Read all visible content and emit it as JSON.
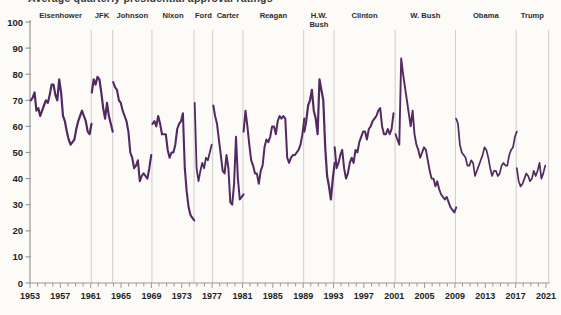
{
  "title": {
    "text": "Average quarterly presidential approval ratings"
  },
  "chart_data": {
    "type": "line",
    "title": "Average quarterly presidential approval ratings",
    "xlabel": "",
    "ylabel": "",
    "ylim": [
      0,
      100
    ],
    "yticks": [
      0,
      10,
      20,
      30,
      40,
      50,
      60,
      70,
      80,
      90,
      100
    ],
    "xticks": [
      1953,
      1957,
      1961,
      1965,
      1969,
      1973,
      1977,
      1981,
      1985,
      1989,
      1993,
      1997,
      2001,
      2005,
      2009,
      2013,
      2017,
      2021
    ],
    "x_start": 1953,
    "x_end": 2021.35,
    "grid": "vertical-president-boundaries-only",
    "legend": "none",
    "line_color": "#522a61",
    "grid_color": "#cdcdcd",
    "axis_color": "#9a9a9a",
    "boundaries": [
      1961.07,
      1963.9,
      1969.07,
      1974.62,
      1977.07,
      1981.07,
      1989.07,
      1993.07,
      2001.12,
      2009.07,
      2017.07,
      2021.35
    ],
    "quarter_step": 0.25,
    "presidents": [
      {
        "name": "Eisenhower",
        "label_lines": [
          "Eisenhower"
        ],
        "start": 1953.1,
        "stroke_width": 2.2,
        "values": [
          70,
          71,
          73,
          66,
          67,
          64,
          66,
          68,
          70,
          69,
          72,
          76,
          76,
          72,
          70,
          78,
          73,
          64,
          62,
          58,
          55,
          53,
          54,
          55,
          59,
          62,
          64,
          66,
          64,
          62,
          58,
          57,
          61
        ]
      },
      {
        "name": "JFK",
        "label_lines": [
          "JFK"
        ],
        "start": 1961.15,
        "stroke_width": 2.2,
        "values": [
          73,
          78,
          76,
          79,
          78,
          73,
          67,
          63,
          69,
          64,
          61,
          58
        ]
      },
      {
        "name": "Johnson",
        "label_lines": [
          "Johnson"
        ],
        "start": 1963.97,
        "stroke_width": 2.1,
        "values": [
          77,
          75,
          74,
          70,
          69,
          66,
          64,
          62,
          58,
          50,
          48,
          44,
          45,
          47,
          39,
          41,
          42,
          41,
          40,
          44,
          49
        ]
      },
      {
        "name": "Nixon",
        "label_lines": [
          "Nixon"
        ],
        "start": 1969.15,
        "stroke_width": 2.1,
        "values": [
          61,
          62,
          60,
          64,
          61,
          57,
          57,
          57,
          51,
          48,
          50,
          50,
          53,
          59,
          61,
          62,
          65,
          44,
          35,
          29,
          26,
          25,
          24
        ]
      },
      {
        "name": "Ford",
        "label_lines": [
          "Ford"
        ],
        "start": 1974.7,
        "stroke_width": 1.8,
        "values": [
          69,
          44,
          39,
          43,
          46,
          44,
          48,
          47,
          50,
          53
        ]
      },
      {
        "name": "Carter",
        "label_lines": [
          "Carter"
        ],
        "start": 1977.15,
        "stroke_width": 2.0,
        "values": [
          68,
          64,
          61,
          55,
          49,
          43,
          42,
          49,
          44,
          31,
          30,
          38,
          56,
          40,
          32,
          33,
          34
        ]
      },
      {
        "name": "Reagan",
        "label_lines": [
          "Reagan"
        ],
        "start": 1981.15,
        "stroke_width": 2.0,
        "values": [
          58,
          66,
          60,
          53,
          47,
          45,
          42,
          42,
          38,
          43,
          45,
          52,
          55,
          54,
          56,
          60,
          60,
          57,
          62,
          64,
          63,
          64,
          63,
          48,
          46,
          48,
          49,
          49,
          50,
          51,
          53,
          57,
          63
        ]
      },
      {
        "name": "H.W. Bush",
        "label_lines": [
          "H.W.",
          "Bush"
        ],
        "start": 1989.15,
        "stroke_width": 2.2,
        "values": [
          58,
          62,
          68,
          70,
          74,
          66,
          63,
          57,
          78,
          74,
          70,
          52,
          41,
          37,
          32,
          40,
          46
        ]
      },
      {
        "name": "Clinton",
        "label_lines": [
          "Clinton"
        ],
        "start": 1993.15,
        "stroke_width": 2.0,
        "values": [
          52,
          44,
          46,
          49,
          51,
          44,
          40,
          42,
          46,
          48,
          46,
          51,
          50,
          54,
          56,
          58,
          58,
          55,
          59,
          60,
          62,
          63,
          64,
          66,
          67,
          60,
          57,
          57,
          59,
          57,
          59,
          65
        ]
      },
      {
        "name": "W. Bush",
        "label_lines": [
          "W. Bush"
        ],
        "start": 2001.17,
        "stroke_width": 1.9,
        "values": [
          57,
          55,
          53,
          86,
          80,
          75,
          70,
          65,
          60,
          66,
          57,
          53,
          51,
          48,
          50,
          52,
          51,
          47,
          43,
          40,
          40,
          37,
          39,
          36,
          34,
          33,
          32,
          33,
          31,
          29,
          28,
          27,
          29
        ]
      },
      {
        "name": "Obama",
        "label_lines": [
          "Obama"
        ],
        "start": 2009.15,
        "stroke_width": 1.7,
        "values": [
          63,
          61,
          53,
          50,
          49,
          48,
          45,
          45,
          47,
          46,
          41,
          43,
          45,
          47,
          49,
          52,
          51,
          48,
          44,
          41,
          43,
          43,
          41,
          42,
          45,
          46,
          45,
          45,
          49,
          51,
          52,
          56,
          58
        ]
      },
      {
        "name": "Trump",
        "label_lines": [
          "Trump"
        ],
        "start": 2017.15,
        "stroke_width": 1.7,
        "values": [
          44,
          39,
          37,
          38,
          40,
          42,
          41,
          39,
          40,
          43,
          41,
          43,
          46,
          40,
          42,
          45
        ]
      }
    ]
  }
}
